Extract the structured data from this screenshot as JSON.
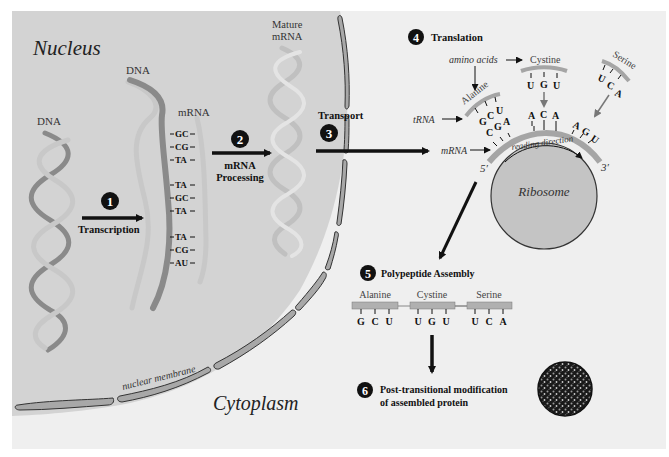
{
  "diagram": {
    "regions": {
      "nucleus_label": "Nucleus",
      "cytoplasm_label": "Cytoplasm",
      "membrane_label": "nuclear membrane"
    },
    "labels": {
      "dna_1": "DNA",
      "dna_2": "DNA",
      "mrna": "mRNA",
      "mature_mrna_1": "Mature",
      "mature_mrna_2": "mRNA",
      "amino_acids": "amino acids",
      "trna": "tRNA",
      "mrna_ribosome": "mRNA",
      "reading_direction": "reading direction",
      "five_prime": "5′",
      "three_prime": "3′",
      "ribosome": "Ribosome"
    },
    "base_pairs": [
      "GC",
      "CG",
      "TA",
      "TA",
      "GC",
      "TA",
      "TA",
      "CG",
      "AU"
    ],
    "steps": [
      {
        "number": "1",
        "label": "Transcription"
      },
      {
        "number": "2",
        "label_1": "mRNA",
        "label_2": "Processing"
      },
      {
        "number": "3",
        "label": "Transport"
      },
      {
        "number": "4",
        "label": "Translation"
      },
      {
        "number": "5",
        "label": "Polypeptide Assembly"
      },
      {
        "number": "6",
        "label_1": "Post-transitional modification",
        "label_2": "of assembled protein"
      }
    ],
    "trna": [
      {
        "amino_acid": "Alanine",
        "anticodon": [
          "G",
          "C",
          "U"
        ],
        "codon": [
          "C",
          "G",
          "A"
        ]
      },
      {
        "amino_acid": "Cystine",
        "anticodon": [
          "U",
          "G",
          "U"
        ],
        "codon": [
          "A",
          "C",
          "A"
        ]
      },
      {
        "amino_acid": "Serine",
        "anticodon": [
          "U",
          "C",
          "A"
        ],
        "codon": [
          "A",
          "G",
          "U"
        ]
      }
    ],
    "polypeptide": [
      {
        "amino_acid": "Alanine",
        "bases": [
          "G",
          "C",
          "U"
        ]
      },
      {
        "amino_acid": "Cystine",
        "bases": [
          "U",
          "G",
          "U"
        ]
      },
      {
        "amino_acid": "Serine",
        "bases": [
          "U",
          "C",
          "A"
        ]
      }
    ],
    "colors": {
      "cytoplasm": "#efefef",
      "nucleus": "#d3d3d3",
      "membrane": "#a8a8a8",
      "dna_dark": "#8a8a8a",
      "dna_light": "#c8c8c8",
      "ribosome": "#c4c4c4",
      "ink": "#111111"
    }
  }
}
